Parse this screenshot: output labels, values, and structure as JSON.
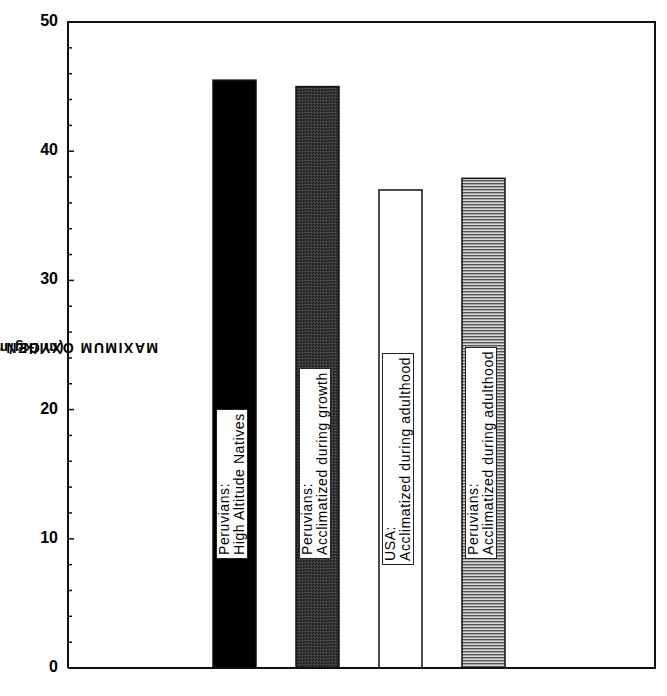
{
  "chart_data": {
    "type": "bar",
    "title": "",
    "xlabel": "",
    "ylabel": "MAXIMUM OXYGEN CONSUMPTION (ml/kg/min)",
    "ylabel_main": "MAXIMUM  OXYGEN  CONSUMPTION",
    "ylabel_unit": "(ml/kg/min)",
    "ylim": [
      0,
      50
    ],
    "yticks": [
      0,
      10,
      20,
      30,
      40,
      50
    ],
    "minor_tick_step": 2,
    "grid": false,
    "legend": "none (labels inside bars)",
    "categories": [
      "Peruvians: High Altitude Natives",
      "Peruvians: Acclimatized during growth",
      "USA: Acclimatized during adulthood",
      "Peruvians: Acclimatized during adulthood"
    ],
    "values": [
      45.5,
      45.0,
      37.0,
      37.9
    ],
    "bars": [
      {
        "line1": "Peruvians:",
        "line2": "High Altitude Natives",
        "value": 45.5,
        "fill": "solid-black",
        "color": "#000000"
      },
      {
        "line1": "Peruvians:",
        "line2": "Acclimatized during growth",
        "value": 45.0,
        "fill": "dark-stipple",
        "color": "#2a2a2a"
      },
      {
        "line1": "USA:",
        "line2": "Acclimatized during adulthood",
        "value": 37.0,
        "fill": "white",
        "color": "#ffffff"
      },
      {
        "line1": "Peruvians:",
        "line2": "Acclimatized during adulthood",
        "value": 37.9,
        "fill": "horizontal-lines",
        "color": "#6a6a6a"
      }
    ]
  }
}
